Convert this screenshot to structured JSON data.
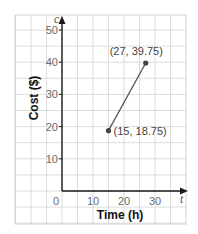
{
  "chart_data": {
    "type": "line",
    "title": "",
    "xlabel": "Time (h)",
    "ylabel": "Cost ($)",
    "x_variable": "t",
    "y_variable": "c",
    "x_ticks": [
      "0",
      "10",
      "20",
      "30"
    ],
    "y_ticks": [
      "10",
      "20",
      "30",
      "40",
      "50"
    ],
    "xlim": [
      0,
      38
    ],
    "ylim": [
      0,
      52
    ],
    "grid": true,
    "series": [
      {
        "name": "Cost",
        "points": [
          {
            "x": 15,
            "y": 18.75,
            "label": "(15, 18.75)"
          },
          {
            "x": 27,
            "y": 39.75,
            "label": "(27, 39.75)"
          }
        ]
      }
    ],
    "colors": {
      "grid": "#d4d4d4",
      "axis": "#1a1a1a",
      "line": "#555555",
      "point": "#444444"
    }
  }
}
